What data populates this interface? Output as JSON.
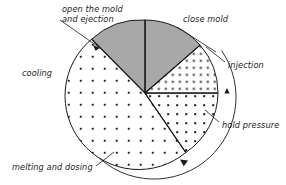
{
  "diagram": {
    "type": "pie-cycle-diagram",
    "center": {
      "x": 145,
      "y": 93
    },
    "pie_radius": 73,
    "ring_radius": 82,
    "rotation_direction": "clockwise",
    "colors": {
      "gray_sector_fill": "#a8a8a8",
      "white_fill": "#ffffff",
      "stroke": "#1a1a1a",
      "dot": "#1a1a1a",
      "background": "#ffffff"
    },
    "sectors": [
      {
        "id": "close-mold",
        "label": "close mold",
        "fill": "gray",
        "start_angle_deg": 270,
        "end_angle_deg": 319,
        "label_x": 183,
        "label_y": 22,
        "leader": {
          "x1": 177,
          "y1": 27,
          "x2": 216,
          "y2": 52
        }
      },
      {
        "id": "injection",
        "label": "injection",
        "fill": "dense-dots",
        "start_angle_deg": 319,
        "end_angle_deg": 360,
        "label_x": 228,
        "label_y": 68,
        "leader": {
          "x1": 225,
          "y1": 62,
          "x2": 206,
          "y2": 47
        }
      },
      {
        "id": "hold-pressure",
        "label": "hold pressure",
        "fill": "medium-dots",
        "start_angle_deg": 0,
        "end_angle_deg": 56,
        "label_x": 222,
        "label_y": 128,
        "leader": {
          "x1": 219,
          "y1": 122,
          "x2": 205,
          "y2": 110
        }
      },
      {
        "id": "melting-and-dosing",
        "label": "melting and dosing",
        "fill": "sparse-dots",
        "start_angle_deg": 56,
        "end_angle_deg": 223,
        "label_x": 12,
        "label_y": 170,
        "leader": {
          "x1": 96,
          "y1": 166,
          "x2": 114,
          "y2": 152
        }
      },
      {
        "id": "open-the-mold-and-ejection",
        "label_line1": "open the mold",
        "label_line2": "and ejection",
        "fill": "gray",
        "start_angle_deg": 223,
        "end_angle_deg": 270,
        "label_x": 62,
        "label_y": 12,
        "leader": {
          "x1": 60,
          "y1": 20,
          "x2": 100,
          "y2": 48
        }
      }
    ],
    "outer_labels": [
      {
        "id": "cooling",
        "label": "cooling",
        "label_x": 22,
        "label_y": 76
      }
    ]
  }
}
